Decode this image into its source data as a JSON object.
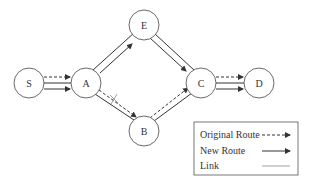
{
  "diagram": {
    "nodes": [
      {
        "id": "S",
        "label": "S",
        "x": 29,
        "y": 83
      },
      {
        "id": "A",
        "label": "A",
        "x": 86,
        "y": 83
      },
      {
        "id": "E",
        "label": "E",
        "x": 144,
        "y": 25
      },
      {
        "id": "B",
        "label": "B",
        "x": 144,
        "y": 131
      },
      {
        "id": "C",
        "label": "C",
        "x": 201,
        "y": 83
      },
      {
        "id": "D",
        "label": "D",
        "x": 259,
        "y": 83
      }
    ],
    "original_route": [
      "S",
      "A",
      "B",
      "C",
      "D"
    ],
    "new_route": [
      "S",
      "A",
      "E",
      "C",
      "D"
    ],
    "broken_link": [
      "A",
      "B"
    ],
    "colors": {
      "stroke": "#333333",
      "node_fill": "#ffffff"
    }
  },
  "legend": {
    "items": [
      {
        "label": "Original Route",
        "style": "dashed-arrow"
      },
      {
        "label": "New Route",
        "style": "solid-arrow"
      },
      {
        "label": "Link",
        "style": "line"
      }
    ]
  }
}
